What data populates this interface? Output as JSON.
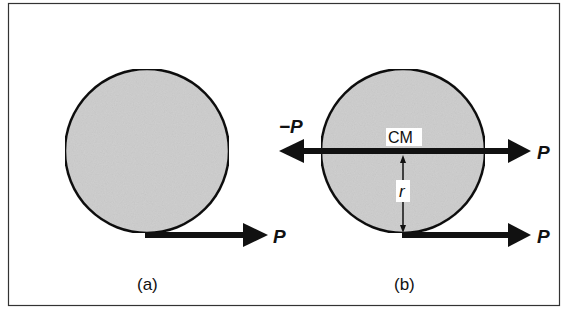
{
  "figure": {
    "colors": {
      "background": "#ffffff",
      "frame": "#333333",
      "disk_fill": "#cfcfcf",
      "ink": "#111111"
    },
    "panel_a": {
      "caption": "(a)",
      "force_label": "P"
    },
    "panel_b": {
      "caption": "(b)",
      "cm_label": "CM",
      "radius_label": "r",
      "force_left_label": "−P",
      "force_top_right_label": "P",
      "force_bottom_right_label": "P"
    }
  }
}
